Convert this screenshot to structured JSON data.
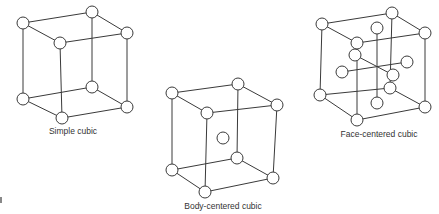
{
  "diagram": {
    "structures": [
      {
        "id": "simple-cubic",
        "label": "Simple cubic",
        "label_pos": [
          73,
          128
        ],
        "atom_radius": 6,
        "corners": {
          "btl": [
            23,
            23
          ],
          "btr": [
            92,
            12
          ],
          "ftl": [
            60,
            43
          ],
          "ftr": [
            127,
            33
          ],
          "bbl": [
            23,
            99
          ],
          "bbr": [
            92,
            87
          ],
          "fbl": [
            62,
            118
          ],
          "fbr": [
            127,
            107
          ]
        },
        "extra_atoms": []
      },
      {
        "id": "body-centered-cubic",
        "label": "Body-centered cubic",
        "label_pos": [
          223,
          203
        ],
        "atom_radius": 6,
        "corners": {
          "btl": [
            172,
            93
          ],
          "btr": [
            238,
            84
          ],
          "ftl": [
            207,
            113
          ],
          "ftr": [
            277,
            105
          ],
          "bbl": [
            172,
            170
          ],
          "bbr": [
            237,
            158
          ],
          "fbl": [
            205,
            192
          ],
          "fbr": [
            273,
            178
          ]
        },
        "extra_atoms": [
          [
            223,
            138
          ]
        ]
      },
      {
        "id": "face-centered-cubic",
        "label": "Face-centered cubic",
        "label_pos": [
          379,
          131
        ],
        "atom_radius": 6,
        "corners": {
          "btl": [
            322,
            24
          ],
          "btr": [
            392,
            13
          ],
          "ftl": [
            357,
            43
          ],
          "ftr": [
            425,
            33
          ],
          "bbl": [
            320,
            95
          ],
          "bbr": [
            390,
            88
          ],
          "fbl": [
            357,
            120
          ],
          "fbr": [
            425,
            107
          ]
        },
        "extra_atoms": [
          [
            377,
            28
          ],
          [
            355,
            55
          ],
          [
            342,
            72
          ],
          [
            407,
            62
          ],
          [
            393,
            75
          ],
          [
            377,
            103
          ]
        ]
      }
    ]
  },
  "labels": {
    "simple": "Simple cubic",
    "bcc": "Body-centered cubic",
    "fcc": "Face-centered cubic"
  }
}
